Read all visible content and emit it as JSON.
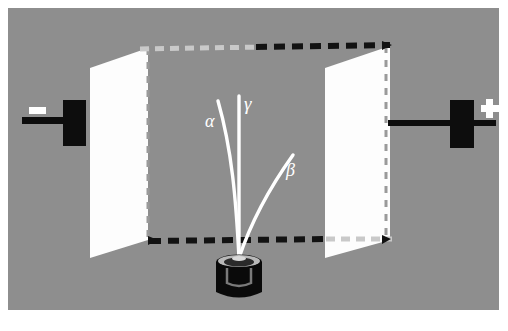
{
  "figure": {
    "background_color": "#8e8e8e",
    "plate_color": "#ffffff",
    "electrode_color": "#0d0d0d",
    "ray_color": "#ffffff",
    "field_line_color": "#111111"
  },
  "electrodes": {
    "negative": {
      "sign_label": "−",
      "name": "negative-electrode",
      "polarity": "negative",
      "side": "left"
    },
    "positive": {
      "sign_label": "+",
      "name": "positive-electrode",
      "polarity": "positive",
      "side": "right"
    }
  },
  "plates": [
    {
      "name": "left-capacitor-plate",
      "side": "left"
    },
    {
      "name": "right-capacitor-plate",
      "side": "right"
    }
  ],
  "source": {
    "name": "radioactive-source-container",
    "description": "lead container holding radioactive sample"
  },
  "rays": [
    {
      "id": "alpha",
      "label": "α",
      "deflection": "left",
      "label_x": 205,
      "label_y": 127
    },
    {
      "id": "gamma",
      "label": "γ",
      "deflection": "none",
      "label_x": 244,
      "label_y": 110
    },
    {
      "id": "beta",
      "label": "β",
      "deflection": "right",
      "label_x": 286,
      "label_y": 176
    }
  ]
}
